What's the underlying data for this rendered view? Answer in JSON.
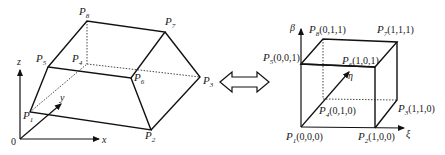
{
  "left_figure": {
    "title": "physical hexahedron (trapezoidal prism)",
    "axes": {
      "origin": "0",
      "x": "x",
      "y": "y",
      "z": "z"
    },
    "vertices": [
      {
        "name": "P",
        "sub": "1"
      },
      {
        "name": "P",
        "sub": "2"
      },
      {
        "name": "P",
        "sub": "3"
      },
      {
        "name": "P",
        "sub": "4"
      },
      {
        "name": "P",
        "sub": "5"
      },
      {
        "name": "P",
        "sub": "6"
      },
      {
        "name": "P",
        "sub": "7"
      },
      {
        "name": "P",
        "sub": "8"
      }
    ]
  },
  "mapping_arrow": {
    "icon": "double-arrow-icon",
    "meaning": "bidirectional mapping"
  },
  "right_figure": {
    "title": "reference unit cube",
    "axes": {
      "xi": "ξ",
      "eta": "η",
      "beta": "β"
    },
    "vertices": [
      {
        "name": "P",
        "sub": "1",
        "coord": "(0,0,0)"
      },
      {
        "name": "P",
        "sub": "2",
        "coord": "(1,0,0)"
      },
      {
        "name": "P",
        "sub": "3",
        "coord": "(1,1,0)"
      },
      {
        "name": "P",
        "sub": "4",
        "coord": "(0,1,0)"
      },
      {
        "name": "P",
        "sub": "5",
        "coord": "(0,0,1)"
      },
      {
        "name": "P",
        "sub": "6",
        "coord": "(1,0,1)"
      },
      {
        "name": "P",
        "sub": "7",
        "coord": "(1,1,1)"
      },
      {
        "name": "P",
        "sub": "8",
        "coord": "(0,1,1)"
      }
    ]
  },
  "colors": {
    "line": "#111111",
    "background": "#ffffff"
  }
}
